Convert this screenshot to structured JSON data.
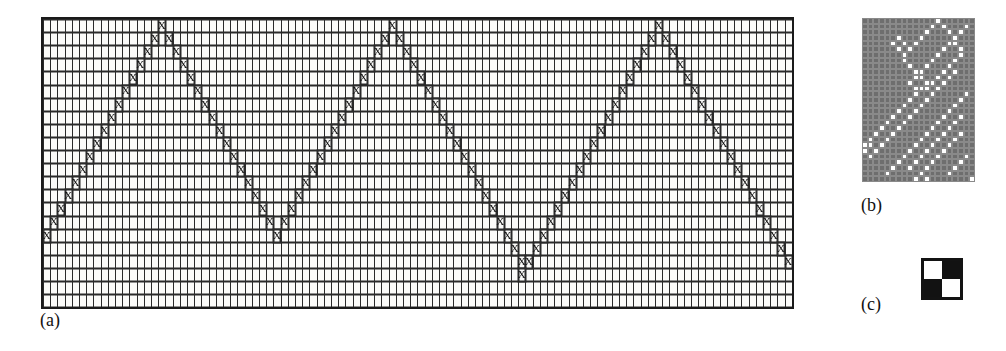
{
  "figure": {
    "panels": [
      {
        "id": "a",
        "caption": "(a)"
      },
      {
        "id": "b",
        "caption": "(b)"
      },
      {
        "id": "c",
        "caption": "(c)"
      }
    ]
  },
  "panel_a": {
    "caption": "(a)",
    "mark_glyph": "X",
    "columns": 104,
    "rows": 22,
    "cell_width": 7.2,
    "cell_height": 13.1,
    "grid_line_color": "#2a2a2a",
    "border_color": "#141414",
    "background_color": "#fbfbf9",
    "description": "Rule-90 style space-time diagram: X marks trace diverging and converging diagonal lines from three seed sites.",
    "seeds": [
      16,
      48,
      85
    ],
    "marked_cells": [
      {
        "row": 0,
        "cols": [
          16,
          48,
          85
        ]
      },
      {
        "row": 1,
        "cols": [
          15,
          17,
          47,
          49,
          84,
          86
        ]
      },
      {
        "row": 2,
        "cols": [
          14,
          18,
          46,
          50,
          83,
          87
        ]
      },
      {
        "row": 3,
        "cols": [
          13,
          19,
          45,
          51,
          82,
          88
        ]
      },
      {
        "row": 4,
        "cols": [
          12,
          20,
          44,
          52,
          81,
          89
        ]
      },
      {
        "row": 5,
        "cols": [
          11,
          21,
          43,
          53,
          80,
          90
        ]
      },
      {
        "row": 6,
        "cols": [
          10,
          22,
          42,
          54,
          79,
          91
        ]
      },
      {
        "row": 7,
        "cols": [
          9,
          23,
          41,
          55,
          78,
          92
        ]
      },
      {
        "row": 8,
        "cols": [
          8,
          24,
          40,
          56,
          77,
          93
        ]
      },
      {
        "row": 9,
        "cols": [
          7,
          25,
          39,
          57,
          76,
          94
        ]
      },
      {
        "row": 10,
        "cols": [
          6,
          26,
          38,
          58,
          75,
          95
        ]
      },
      {
        "row": 11,
        "cols": [
          5,
          27,
          37,
          59,
          74,
          96
        ]
      },
      {
        "row": 12,
        "cols": [
          4,
          28,
          36,
          60,
          73,
          97
        ]
      },
      {
        "row": 13,
        "cols": [
          3,
          29,
          35,
          61,
          72,
          98
        ]
      },
      {
        "row": 14,
        "cols": [
          2,
          30,
          34,
          62,
          71,
          99
        ]
      },
      {
        "row": 15,
        "cols": [
          1,
          31,
          33,
          63,
          70,
          100
        ]
      },
      {
        "row": 16,
        "cols": [
          0,
          32,
          64,
          69,
          101
        ]
      },
      {
        "row": 17,
        "cols": [
          65,
          68,
          102
        ]
      },
      {
        "row": 18,
        "cols": [
          66,
          67,
          103
        ]
      },
      {
        "row": 19,
        "cols": [
          66
        ]
      }
    ]
  },
  "panel_b": {
    "caption": "(b)",
    "columns": 20,
    "rows": 29,
    "cell_size": 5.65,
    "on_color": "#ffffff",
    "off_color": "#6e6e6e",
    "gridline_color": "#8a8a8a",
    "description": "Coarse pixel rendering of the same automaton: white cells on a dark-gray field form crossing diagonal bands.",
    "white_cells": [
      {
        "row": 0,
        "cols": [
          13
        ]
      },
      {
        "row": 1,
        "cols": [
          12,
          14,
          18
        ]
      },
      {
        "row": 2,
        "cols": [
          11,
          15,
          17
        ]
      },
      {
        "row": 3,
        "cols": [
          6,
          10,
          16
        ]
      },
      {
        "row": 4,
        "cols": [
          5,
          7,
          9,
          15,
          16
        ]
      },
      {
        "row": 5,
        "cols": [
          6,
          8,
          14,
          17
        ]
      },
      {
        "row": 6,
        "cols": [
          7,
          13,
          17
        ]
      },
      {
        "row": 7,
        "cols": [
          7,
          12,
          16
        ]
      },
      {
        "row": 8,
        "cols": [
          8,
          11,
          15
        ]
      },
      {
        "row": 9,
        "cols": [
          9,
          10,
          14,
          16
        ]
      },
      {
        "row": 10,
        "cols": [
          9,
          10,
          13,
          15
        ]
      },
      {
        "row": 11,
        "cols": [
          8,
          11,
          12,
          14
        ]
      },
      {
        "row": 12,
        "cols": [
          9,
          10,
          11,
          13
        ]
      },
      {
        "row": 13,
        "cols": [
          9,
          12,
          18
        ]
      },
      {
        "row": 14,
        "cols": [
          8,
          11,
          17
        ]
      },
      {
        "row": 15,
        "cols": [
          7,
          10,
          16
        ]
      },
      {
        "row": 16,
        "cols": [
          6,
          9,
          15
        ]
      },
      {
        "row": 17,
        "cols": [
          5,
          8,
          14,
          17
        ]
      },
      {
        "row": 18,
        "cols": [
          4,
          7,
          13,
          16
        ]
      },
      {
        "row": 19,
        "cols": [
          3,
          6,
          12,
          15
        ]
      },
      {
        "row": 20,
        "cols": [
          2,
          5,
          11,
          14,
          17
        ]
      },
      {
        "row": 21,
        "cols": [
          1,
          4,
          10,
          13,
          16
        ]
      },
      {
        "row": 22,
        "cols": [
          0,
          1,
          3,
          9,
          12,
          15
        ]
      },
      {
        "row": 23,
        "cols": [
          0,
          2,
          8,
          11,
          14
        ]
      },
      {
        "row": 24,
        "cols": [
          1,
          7,
          10,
          13,
          18
        ]
      },
      {
        "row": 25,
        "cols": [
          6,
          9,
          12,
          17
        ]
      },
      {
        "row": 26,
        "cols": [
          5,
          8,
          11,
          16
        ]
      },
      {
        "row": 27,
        "cols": [
          4,
          10,
          15
        ]
      },
      {
        "row": 28,
        "cols": [
          9,
          11,
          19
        ]
      }
    ]
  },
  "panel_c": {
    "caption": "(c)",
    "description": "Two-by-two legend tile: alternating white and black squares.",
    "cells": [
      {
        "position": "top-left",
        "color": "#ffffff"
      },
      {
        "position": "top-right",
        "color": "#121212"
      },
      {
        "position": "bottom-left",
        "color": "#121212"
      },
      {
        "position": "bottom-right",
        "color": "#ffffff"
      }
    ],
    "border_color": "#131313"
  }
}
